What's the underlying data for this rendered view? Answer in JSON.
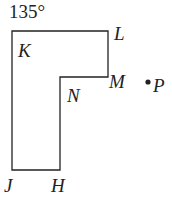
{
  "diagram": {
    "angle_label": "135°",
    "vertices": {
      "K": "K",
      "L": "L",
      "M": "M",
      "N": "N",
      "H": "H",
      "J": "J"
    },
    "point": "P",
    "colors": {
      "stroke": "#222222",
      "background": "#ffffff"
    }
  }
}
